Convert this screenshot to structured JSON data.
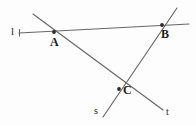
{
  "figure": {
    "background_color": "#fdfdfd",
    "line_color": "#666666",
    "point_color": "#2b2b2b",
    "label_color": "#1c1c1c",
    "width": 196,
    "height": 125,
    "points": [
      {
        "name": "A",
        "label": "A",
        "x": 54,
        "y": 32,
        "label_x": 50,
        "label_y": 36
      },
      {
        "name": "B",
        "label": "B",
        "x": 162,
        "y": 25,
        "label_x": 161,
        "label_y": 28
      },
      {
        "name": "C",
        "label": "C",
        "x": 119,
        "y": 89,
        "label_x": 123,
        "label_y": 84
      }
    ],
    "lines": [
      {
        "name": "l",
        "label": "l",
        "label_x": 11,
        "label_y": 26,
        "x1": 19,
        "y1": 33,
        "x2": 189,
        "y2": 24,
        "has_end_serif": true
      },
      {
        "name": "t",
        "label": "t",
        "label_x": 166,
        "label_y": 107,
        "x1": 33,
        "y1": 14,
        "x2": 163,
        "y2": 110,
        "has_end_serif": false
      },
      {
        "name": "s",
        "label": "s",
        "label_x": 94,
        "label_y": 106,
        "x1": 177,
        "y1": 8,
        "x2": 103,
        "y2": 117,
        "has_end_serif": false
      }
    ]
  }
}
